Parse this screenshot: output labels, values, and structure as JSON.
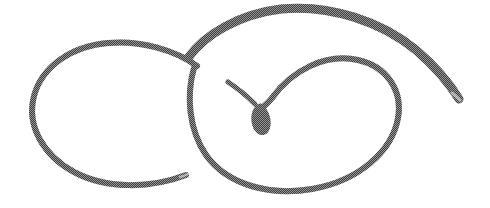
{
  "canvas": {
    "width": 490,
    "height": 208,
    "background_color": "#ffffff",
    "title": "abstract-looping-line-drawing"
  },
  "artwork": {
    "name": "double-loop-spiral-with-teardrop",
    "description": "Continuous freehand curve forming two interlocking oval lobes that cross at upper left of center, spiralling inward to a small filled teardrop, with a long tapering tail sweeping to the upper right.",
    "medium": "dithered grayscale scanned line drawing",
    "ink_color": "#7c7c7c",
    "ink_color_dark": "#6e6e6e",
    "background_color": "#ffffff",
    "stroke_widths": {
      "thick": 9,
      "medium": 6,
      "thin": 4.5,
      "hairline": 2.5
    },
    "strokes": [
      {
        "name": "left-lobe",
        "stroke_width": 6,
        "path": "M 197 66 C 175 50 140 40 108 43 C 72 46 42 66 34 96 C 26 126 44 156 74 172 C 108 190 152 188 186 175"
      },
      {
        "name": "upper-arc-and-tail",
        "stroke_width": 9,
        "path": "M 188 58 C 205 34 240 14 281 9 C 330 4 382 22 416 50 C 437 68 451 86 459 99"
      },
      {
        "name": "right-lobe-inner-spiral",
        "stroke_width": 6,
        "path": "M 194 68 C 186 96 189 130 206 155 C 228 186 272 196 312 189 C 358 181 392 152 398 118 C 403 90 386 66 358 60 C 326 53 292 70 272 98 C 268 103 265 105 263 107"
      },
      {
        "name": "teardrop-terminal",
        "stroke_width": 0,
        "fill": "#757575",
        "path": "M 262 104 C 269 110 272 120 270 128 C 268 135 262 137 257 133 C 251 128 250 117 253 110 C 255 106 259 102 262 104 Z"
      },
      {
        "name": "teardrop-connector",
        "stroke_width": 5,
        "path": "M 255 104 C 250 99 240 90 228 82"
      }
    ],
    "key_points": {
      "crossing_point": {
        "x": 193,
        "y": 62
      },
      "teardrop_center": {
        "x": 262,
        "y": 119
      },
      "tail_end": {
        "x": 459,
        "y": 99
      },
      "left_lobe_end": {
        "x": 186,
        "y": 175
      },
      "left_extent": {
        "x": 33,
        "y": 98
      },
      "right_extent": {
        "x": 400,
        "y": 120
      },
      "top_extent": {
        "x": 281,
        "y": 8
      },
      "bottom_extent": {
        "x": 295,
        "y": 191
      }
    }
  }
}
